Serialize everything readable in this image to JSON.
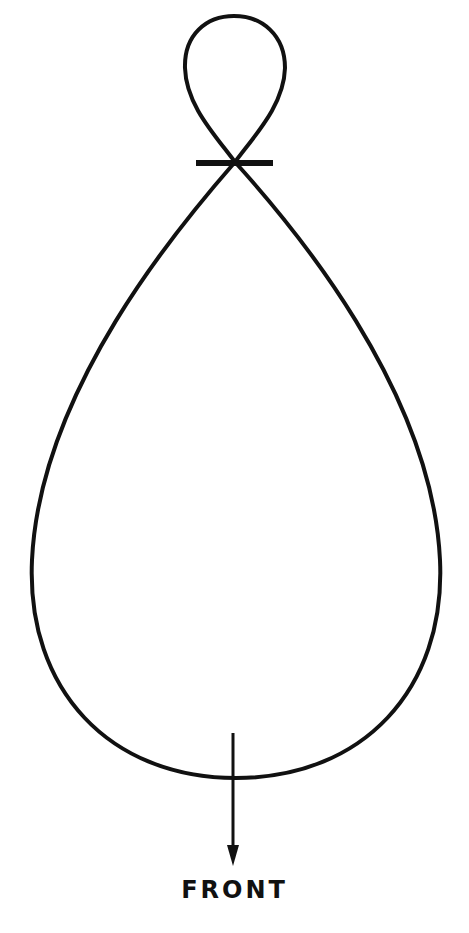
{
  "diagram": {
    "type": "polar-pickup-pattern",
    "direction_label": "FRONT",
    "stroke_color": "#111111",
    "background_color": "#ffffff",
    "elements": {
      "front_lobe": "large teardrop-shaped lobe extending downward",
      "rear_lobe": "small loop extending upward",
      "origin_marker": "short horizontal bar at lobe crossing",
      "arrow": "downward arrow indicating front direction"
    }
  }
}
